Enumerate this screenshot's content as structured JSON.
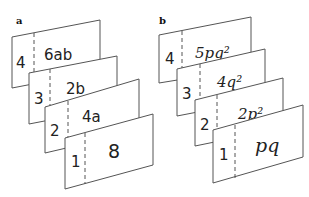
{
  "panels": [
    {
      "label": "a",
      "cards": [
        {
          "index": "4",
          "value": "6ab"
        },
        {
          "index": "3",
          "value": "2b"
        },
        {
          "index": "2",
          "value": "4a"
        },
        {
          "index": "1",
          "value": "8"
        }
      ]
    },
    {
      "label": "b",
      "cards": [
        {
          "index": "4",
          "value": "5pq²"
        },
        {
          "index": "3",
          "value": "4q²"
        },
        {
          "index": "2",
          "value": "2p²"
        },
        {
          "index": "1",
          "value": "pq"
        }
      ]
    }
  ],
  "colors": {
    "line": "#555555",
    "text": "#222222",
    "background": "#ffffff"
  }
}
